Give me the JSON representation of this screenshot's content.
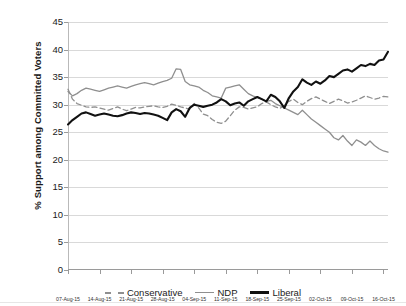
{
  "chart_data": {
    "type": "line",
    "title": "",
    "xlabel": "",
    "ylabel": "% Support among Committed Voters",
    "ylim": [
      0,
      45
    ],
    "yticks": [
      0,
      5,
      10,
      15,
      20,
      25,
      30,
      35,
      40,
      45
    ],
    "grid": true,
    "legend_position": "bottom-center",
    "x_tick_labels": [
      "07-Aug-15",
      "14-Aug-15",
      "21-Aug-15",
      "28-Aug-15",
      "04-Sep-15",
      "11-Sep-15",
      "18-Sep-15",
      "25-Sep-15",
      "02-Oct-15",
      "09-Oct-15",
      "16-Oct-15"
    ],
    "x_tick_positions": [
      0,
      7,
      14,
      21,
      28,
      35,
      42,
      49,
      56,
      63,
      70
    ],
    "x_range": [
      0,
      71
    ],
    "series": [
      {
        "name": "Conservative",
        "color": "#8f8f8f",
        "style": "dashed",
        "x": [
          0,
          1,
          2,
          3,
          4,
          5,
          6,
          7,
          8,
          9,
          10,
          11,
          12,
          13,
          14,
          15,
          16,
          17,
          18,
          19,
          20,
          21,
          22,
          23,
          24,
          25,
          26,
          27,
          28,
          29,
          30,
          31,
          32,
          33,
          34,
          35,
          36,
          37,
          38,
          39,
          40,
          41,
          42,
          43,
          44,
          45,
          46,
          47,
          48,
          49,
          50,
          51,
          52,
          53,
          54,
          55,
          56,
          57,
          58,
          59,
          60,
          61,
          62,
          63,
          64,
          65,
          66,
          67,
          68,
          69,
          70,
          71
        ],
        "values": [
          32.8,
          31.0,
          30.2,
          29.9,
          29.6,
          29.5,
          29.6,
          29.4,
          29.2,
          29.0,
          29.3,
          29.6,
          29.2,
          28.9,
          29.2,
          29.5,
          29.4,
          29.6,
          29.7,
          29.8,
          29.6,
          29.5,
          29.7,
          30.1,
          29.9,
          29.6,
          29.4,
          29.2,
          30.2,
          29.4,
          28.3,
          28.0,
          27.3,
          26.8,
          26.6,
          27.0,
          28.0,
          29.0,
          29.6,
          29.5,
          29.2,
          29.4,
          29.6,
          30.2,
          30.5,
          30.0,
          29.6,
          29.3,
          29.9,
          30.6,
          31.0,
          30.4,
          30.0,
          30.6,
          31.1,
          31.4,
          31.0,
          30.6,
          30.2,
          30.6,
          31.0,
          30.7,
          30.3,
          30.5,
          30.8,
          31.2,
          31.6,
          31.3,
          31.0,
          31.2,
          31.5,
          31.4
        ]
      },
      {
        "name": "NDP",
        "color": "#8f8f8f",
        "style": "solid",
        "x": [
          0,
          1,
          2,
          3,
          4,
          5,
          6,
          7,
          8,
          9,
          10,
          11,
          12,
          13,
          14,
          15,
          16,
          17,
          18,
          19,
          20,
          21,
          22,
          23,
          24,
          25,
          26,
          27,
          28,
          29,
          30,
          31,
          32,
          33,
          34,
          35,
          36,
          37,
          38,
          39,
          40,
          41,
          42,
          43,
          44,
          45,
          46,
          47,
          48,
          49,
          50,
          51,
          52,
          53,
          54,
          55,
          56,
          57,
          58,
          59,
          60,
          61,
          62,
          63,
          64,
          65,
          66,
          67,
          68,
          69,
          70,
          71
        ],
        "values": [
          32.4,
          31.6,
          32.0,
          32.6,
          33.0,
          32.8,
          32.6,
          32.4,
          32.7,
          33.0,
          33.2,
          33.4,
          33.2,
          33.0,
          33.3,
          33.6,
          33.8,
          34.0,
          33.8,
          33.6,
          33.9,
          34.2,
          34.4,
          34.8,
          36.5,
          36.4,
          34.2,
          33.6,
          33.4,
          33.2,
          32.6,
          32.2,
          31.6,
          31.4,
          31.2,
          33.0,
          33.2,
          33.4,
          33.6,
          32.8,
          32.0,
          31.6,
          31.3,
          31.0,
          30.6,
          30.8,
          30.2,
          29.8,
          29.4,
          29.0,
          28.6,
          28.2,
          29.0,
          28.2,
          27.4,
          26.8,
          26.2,
          25.6,
          25.0,
          24.0,
          23.6,
          24.4,
          23.4,
          22.6,
          23.6,
          23.2,
          22.6,
          23.4,
          22.6,
          22.0,
          21.6,
          21.4
        ]
      },
      {
        "name": "Liberal",
        "color": "#111111",
        "style": "solid",
        "x": [
          0,
          1,
          2,
          3,
          4,
          5,
          6,
          7,
          8,
          9,
          10,
          11,
          12,
          13,
          14,
          15,
          16,
          17,
          18,
          19,
          20,
          21,
          22,
          23,
          24,
          25,
          26,
          27,
          28,
          29,
          30,
          31,
          32,
          33,
          34,
          35,
          36,
          37,
          38,
          39,
          40,
          41,
          42,
          43,
          44,
          45,
          46,
          47,
          48,
          49,
          50,
          51,
          52,
          53,
          54,
          55,
          56,
          57,
          58,
          59,
          60,
          61,
          62,
          63,
          64,
          65,
          66,
          67,
          68,
          69,
          70,
          71
        ],
        "values": [
          26.4,
          27.2,
          27.8,
          28.4,
          28.6,
          28.3,
          28.0,
          28.2,
          28.4,
          28.2,
          28.0,
          27.9,
          28.1,
          28.4,
          28.6,
          28.5,
          28.3,
          28.5,
          28.4,
          28.2,
          28.0,
          27.6,
          27.2,
          28.6,
          29.2,
          28.8,
          27.8,
          29.4,
          30.0,
          29.8,
          29.6,
          29.8,
          30.0,
          30.4,
          31.0,
          30.6,
          29.9,
          30.2,
          30.4,
          29.8,
          30.6,
          31.0,
          31.4,
          31.0,
          30.6,
          31.8,
          31.4,
          30.6,
          29.4,
          31.2,
          32.4,
          33.2,
          34.6,
          34.0,
          33.6,
          34.2,
          33.8,
          34.4,
          35.2,
          35.0,
          35.6,
          36.2,
          36.4,
          36.0,
          36.6,
          37.2,
          37.0,
          37.4,
          37.2,
          38.0,
          38.2,
          39.6
        ]
      }
    ]
  }
}
